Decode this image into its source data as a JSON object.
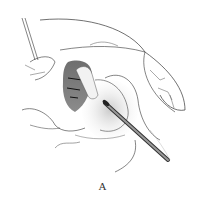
{
  "figure": {
    "panel_label": "A",
    "colors": {
      "line": "#333333",
      "shade_dark": "#3a3a3a",
      "shade_light": "#bdbdbd",
      "background": "#ffffff"
    }
  }
}
